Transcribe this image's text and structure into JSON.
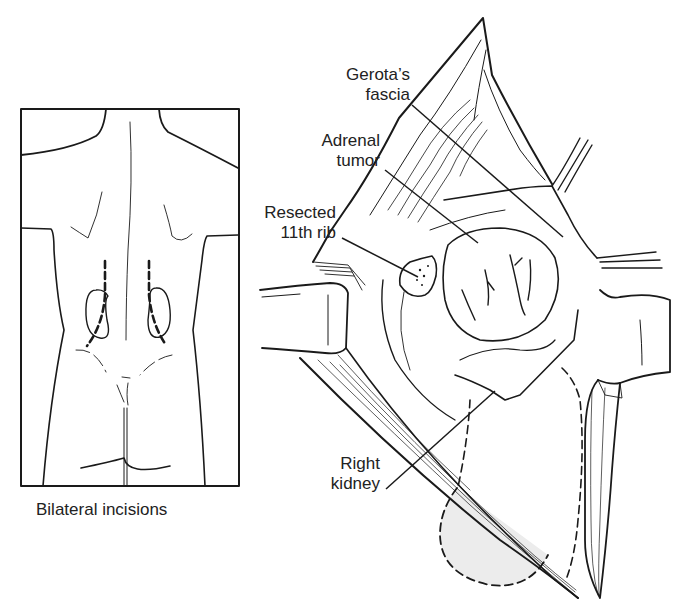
{
  "figure": {
    "inset": {
      "caption": "Bilateral incisions",
      "description": "Posterior view of torso with dashed bilateral flank incision lines over both kidneys"
    },
    "main": {
      "description": "Retracted surgical field via posterior approach exposing right adrenal tumor",
      "labels": {
        "gerota_line1": "Gerota’s",
        "gerota_line2": "fascia",
        "adrenal_line1": "Adrenal",
        "adrenal_line2": "tumor",
        "rib_line1": "Resected",
        "rib_line2": "11th rib",
        "kidney_line1": "Right",
        "kidney_line2": "kidney"
      }
    },
    "colors": {
      "ink": "#1a1a1a",
      "background": "#ffffff",
      "kidney_shade": "#ececec"
    }
  }
}
